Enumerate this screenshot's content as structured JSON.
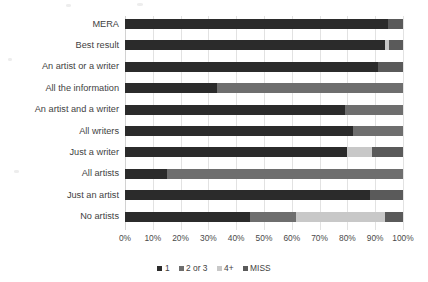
{
  "chart_data": {
    "type": "bar",
    "orientation": "horizontal",
    "stacked": true,
    "normalized": true,
    "title": "",
    "subtitle": "",
    "xlabel": "",
    "ylabel": "",
    "xlim": [
      0,
      100
    ],
    "xticks": [
      "0%",
      "10%",
      "20%",
      "30%",
      "40%",
      "50%",
      "60%",
      "70%",
      "80%",
      "90%",
      "100%"
    ],
    "xtick_values": [
      0,
      10,
      20,
      30,
      40,
      50,
      60,
      70,
      80,
      90,
      100
    ],
    "grid": true,
    "grid_axis": "x",
    "legend_position": "bottom",
    "categories": [
      "MERA",
      "Best result",
      "An artist or a writer",
      "All the information",
      "An artist and a writer",
      "All writers",
      "Just a writer",
      "All artists",
      "Just an artist",
      "No artists"
    ],
    "series": [
      {
        "name": "1",
        "color": "#2b2b2b",
        "values": [
          94.5,
          93.5,
          91.0,
          33.0,
          79.0,
          82.0,
          80.0,
          15.0,
          88.0,
          45.0
        ]
      },
      {
        "name": "2 or 3",
        "color": "#6e6e6e",
        "values": [
          0.0,
          0.0,
          0.0,
          67.0,
          21.0,
          18.0,
          0.0,
          85.0,
          0.0,
          16.5
        ]
      },
      {
        "name": "4+",
        "color": "#c8c8c8",
        "values": [
          0.0,
          1.5,
          0.0,
          0.0,
          0.0,
          0.0,
          9.0,
          0.0,
          0.0,
          32.0
        ]
      },
      {
        "name": "MISS",
        "color": "#5a5a5a",
        "values": [
          5.5,
          5.0,
          9.0,
          0.0,
          0.0,
          0.0,
          11.0,
          0.0,
          12.0,
          6.5
        ]
      }
    ]
  },
  "legend": {
    "entries": [
      {
        "label": "1",
        "color": "#2b2b2b"
      },
      {
        "label": "2 or 3",
        "color": "#6e6e6e"
      },
      {
        "label": "4+",
        "color": "#c8c8c8"
      },
      {
        "label": "MISS",
        "color": "#5a5a5a"
      }
    ]
  },
  "colors": {
    "background": "#ffffff",
    "gridline": "#e2e2e2",
    "text": "#3f3f3f"
  }
}
